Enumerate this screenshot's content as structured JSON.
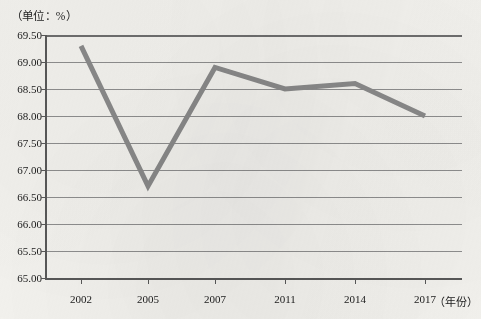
{
  "chart_data": {
    "type": "line",
    "title": "",
    "subtitle": "",
    "unit_label": "（单位：%）",
    "xlabel": "（年份）",
    "ylabel": "",
    "categories": [
      "2002",
      "2005",
      "2007",
      "2011",
      "2014",
      "2017"
    ],
    "values": [
      69.3,
      66.7,
      68.9,
      68.5,
      68.6,
      68.0
    ],
    "series": [
      {
        "name": "",
        "values": [
          69.3,
          66.7,
          68.9,
          68.5,
          68.6,
          68.0
        ]
      }
    ],
    "ylim": [
      65.0,
      69.5
    ],
    "ytick_step": 0.5,
    "ytick_labels": [
      "69.50",
      "69.00",
      "68.50",
      "68.00",
      "67.50",
      "67.00",
      "66.50",
      "66.00",
      "65.50",
      "65.00"
    ],
    "ytick_values": [
      69.5,
      69.0,
      68.5,
      68.0,
      67.5,
      67.0,
      66.5,
      66.0,
      65.5,
      65.0
    ],
    "xtick_labels": [
      "2002",
      "2005",
      "2007",
      "2011",
      "2014",
      "2017"
    ],
    "grid": true,
    "grid_axis": "y",
    "legend": false,
    "legend_position": "none",
    "line_color": "#8a8a8a",
    "line_width": 5,
    "grid_color": "#8e8e8e",
    "axis_color": "#585858",
    "background_color": "#f3f2ee",
    "text_color": "#1b1b1b",
    "markers": false,
    "annotations": []
  }
}
